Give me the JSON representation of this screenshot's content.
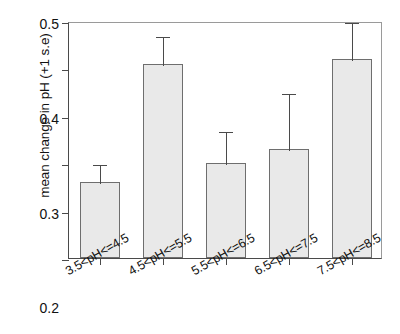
{
  "chart_data": {
    "type": "bar",
    "title": "",
    "xlabel": "",
    "ylabel": "mean change in pH (+1 s.e)",
    "categories": [
      "3.5<pH<=4.5",
      "4.5<pH<=5.5",
      "5.5<pH<=6.5",
      "6.5<pH<=7.5",
      "7.5<pH<=8.5"
    ],
    "values": [
      0.16,
      0.41,
      0.2,
      0.23,
      0.42
    ],
    "errors_upper": [
      0.2,
      0.47,
      0.27,
      0.35,
      0.5
    ],
    "error_type": "+1 s.e.",
    "ylim": [
      0.0,
      0.5
    ],
    "ytick_labels": [
      "0.0",
      "0.1",
      "0.2",
      "0.3",
      "0.4",
      "0.5"
    ],
    "ytick_values": [
      0.0,
      0.1,
      0.2,
      0.3,
      0.4,
      0.5
    ],
    "grid": false,
    "legend": "none",
    "bar_fill_color": "#e9e9e9",
    "bar_edge_color": "#6e6e6e",
    "axis_color": "#4a4a4a"
  }
}
